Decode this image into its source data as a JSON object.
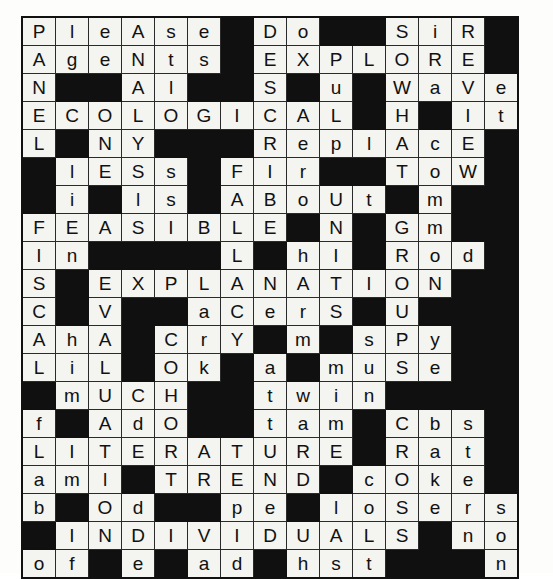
{
  "puzzle": {
    "title": "crossword-grid",
    "columns": 15,
    "rows": 19,
    "block_char": "#",
    "colors": {
      "cell_fill": "#f4f4f0",
      "block_fill": "#101010",
      "grid_line": "#2a2a2a",
      "letter": "#111111",
      "page_background": "#fdfdfc"
    },
    "grid": [
      [
        "P",
        "l",
        "e",
        "A",
        "s",
        "e",
        "#",
        "D",
        "o",
        "#",
        "#",
        "S",
        "i",
        "R",
        "#"
      ],
      [
        "A",
        "g",
        "e",
        "N",
        "t",
        "s",
        "#",
        "E",
        "X",
        "P",
        "L",
        "O",
        "R",
        "E",
        "#"
      ],
      [
        "N",
        "#",
        "#",
        "A",
        "l",
        "#",
        "#",
        "S",
        "#",
        "u",
        "#",
        "W",
        "a",
        "V",
        "e"
      ],
      [
        "E",
        "C",
        "O",
        "L",
        "O",
        "G",
        "I",
        "C",
        "A",
        "L",
        "#",
        "H",
        "#",
        "I",
        "t"
      ],
      [
        "L",
        "#",
        "N",
        "Y",
        "#",
        "#",
        "#",
        "R",
        "e",
        "p",
        "l",
        "A",
        "c",
        "E",
        "#"
      ],
      [
        "#",
        "l",
        "E",
        "S",
        "s",
        "#",
        "F",
        "I",
        "r",
        "#",
        "#",
        "T",
        "o",
        "W",
        "#"
      ],
      [
        "#",
        "i",
        "#",
        "l",
        "s",
        "#",
        "A",
        "B",
        "o",
        "U",
        "t",
        "#",
        "m",
        "#",
        "#"
      ],
      [
        "F",
        "E",
        "A",
        "S",
        "I",
        "B",
        "L",
        "E",
        "#",
        "N",
        "#",
        "G",
        "m",
        "#",
        "#"
      ],
      [
        "I",
        "n",
        "#",
        "#",
        "#",
        "#",
        "L",
        "#",
        "h",
        "I",
        "#",
        "R",
        "o",
        "d",
        "#"
      ],
      [
        "S",
        "#",
        "E",
        "X",
        "P",
        "L",
        "A",
        "N",
        "A",
        "T",
        "I",
        "O",
        "N",
        "#",
        "#"
      ],
      [
        "C",
        "#",
        "V",
        "#",
        "#",
        "a",
        "C",
        "e",
        "r",
        "S",
        "#",
        "U",
        "#",
        "#",
        "#"
      ],
      [
        "A",
        "h",
        "A",
        "#",
        "C",
        "r",
        "Y",
        "#",
        "m",
        "#",
        "s",
        "P",
        "y",
        "#",
        "#"
      ],
      [
        "L",
        "i",
        "L",
        "#",
        "O",
        "k",
        "#",
        "a",
        "#",
        "m",
        "u",
        "S",
        "e",
        "#",
        "#"
      ],
      [
        "#",
        "m",
        "U",
        "C",
        "H",
        "#",
        "#",
        "t",
        "w",
        "i",
        "n",
        "#",
        "#",
        "#",
        "#"
      ],
      [
        "f",
        "#",
        "A",
        "d",
        "O",
        "#",
        "#",
        "t",
        "a",
        "m",
        "#",
        "C",
        "b",
        "s",
        "#"
      ],
      [
        "L",
        "I",
        "T",
        "E",
        "R",
        "A",
        "T",
        "U",
        "R",
        "E",
        "#",
        "R",
        "a",
        "t",
        "#"
      ],
      [
        "a",
        "m",
        "l",
        "#",
        "T",
        "R",
        "E",
        "N",
        "D",
        "#",
        "c",
        "O",
        "k",
        "e",
        "#"
      ],
      [
        "b",
        "#",
        "O",
        "d",
        "#",
        "#",
        "p",
        "e",
        "#",
        "l",
        "o",
        "S",
        "e",
        "r",
        "s"
      ],
      [
        "#",
        "I",
        "N",
        "D",
        "I",
        "V",
        "I",
        "D",
        "U",
        "A",
        "L",
        "S",
        "#",
        "n",
        "o"
      ],
      [
        "o",
        "f",
        "#",
        "e",
        "#",
        "a",
        "d",
        "#",
        "h",
        "s",
        "t",
        "#",
        "#",
        "#",
        "n"
      ]
    ]
  }
}
